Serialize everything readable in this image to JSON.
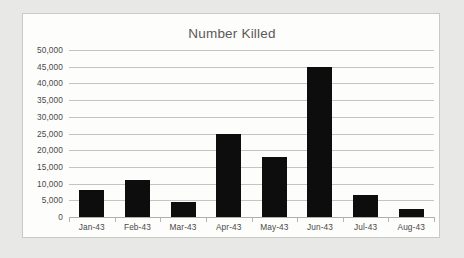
{
  "chart_data": {
    "type": "bar",
    "title": "Number Killed",
    "xlabel": "",
    "ylabel": "",
    "categories": [
      "Jan-43",
      "Feb-43",
      "Mar-43",
      "Apr-43",
      "May-43",
      "Jun-43",
      "Jul-43",
      "Aug-43"
    ],
    "values": [
      8000,
      11000,
      4500,
      25000,
      18000,
      45000,
      6500,
      2300
    ],
    "series": [
      {
        "name": "Number Killed",
        "values": [
          8000,
          11000,
          4500,
          25000,
          18000,
          45000,
          6500,
          2300
        ]
      }
    ],
    "ylim": [
      0,
      50000
    ],
    "ytick_values": [
      0,
      5000,
      10000,
      15000,
      20000,
      25000,
      30000,
      35000,
      40000,
      45000,
      50000
    ],
    "ytick_labels": [
      "0",
      "5,000",
      "10,000",
      "15,000",
      "20,000",
      "25,000",
      "30,000",
      "35,000",
      "40,000",
      "45,000",
      "50,000"
    ],
    "grid": true,
    "legend": false,
    "legend_position": "none",
    "bar_color": "#0d0d0d",
    "gridline_color": "#c4c4c2",
    "plot_background": "#fdfdfc",
    "border_color": "#c9c9c6",
    "text_color": "#4a4a48",
    "title_color": "#5a5a58"
  }
}
